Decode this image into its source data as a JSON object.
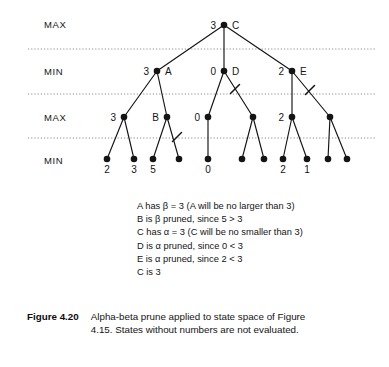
{
  "figure": {
    "number": "Figure 4.20",
    "caption": "Alpha-beta prune applied to state space of Figure 4.15. States without numbers are not evaluated."
  },
  "levels": [
    {
      "label": "MAX",
      "x": 44,
      "y": 19
    },
    {
      "label": "MIN",
      "x": 44,
      "y": 66
    },
    {
      "label": "MAX",
      "x": 44,
      "y": 112
    },
    {
      "label": "MIN",
      "x": 44,
      "y": 155
    }
  ],
  "separators": [
    {
      "y": 49
    },
    {
      "y": 94
    },
    {
      "y": 138
    }
  ],
  "nodes": [
    {
      "id": "C",
      "x": 224,
      "y": 25,
      "value": "3",
      "name": "C",
      "value_side": "left",
      "name_side": "right"
    },
    {
      "id": "A",
      "x": 157,
      "y": 71,
      "value": "3",
      "name": "A",
      "value_side": "left",
      "name_side": "right"
    },
    {
      "id": "D",
      "x": 224,
      "y": 71,
      "value": "0",
      "name": "D",
      "value_side": "left",
      "name_side": "right"
    },
    {
      "id": "E",
      "x": 292,
      "y": 71,
      "value": "2",
      "name": "E",
      "value_side": "left",
      "name_side": "right"
    },
    {
      "id": "m1",
      "x": 124,
      "y": 117,
      "value": "3",
      "name": "",
      "value_side": "left",
      "name_side": "right"
    },
    {
      "id": "B",
      "x": 167,
      "y": 117,
      "value": "",
      "name": "B",
      "value_side": "left",
      "name_side": "left"
    },
    {
      "id": "m3",
      "x": 208,
      "y": 117,
      "value": "0",
      "name": "",
      "value_side": "left",
      "name_side": "right"
    },
    {
      "id": "m4",
      "x": 253,
      "y": 117,
      "value": "",
      "name": "",
      "value_side": "left",
      "name_side": "right"
    },
    {
      "id": "m5",
      "x": 292,
      "y": 117,
      "value": "2",
      "name": "",
      "value_side": "left",
      "name_side": "right"
    },
    {
      "id": "m6",
      "x": 330,
      "y": 117,
      "value": "",
      "name": "",
      "value_side": "left",
      "name_side": "right"
    }
  ],
  "leaves": [
    {
      "id": "l1",
      "x": 107,
      "y": 159,
      "value": "2"
    },
    {
      "id": "l2",
      "x": 134,
      "y": 159,
      "value": "3"
    },
    {
      "id": "l3",
      "x": 153,
      "y": 159,
      "value": "5"
    },
    {
      "id": "l4",
      "x": 179,
      "y": 159,
      "value": ""
    },
    {
      "id": "l5",
      "x": 208,
      "y": 159,
      "value": "0"
    },
    {
      "id": "l6",
      "x": 242,
      "y": 159,
      "value": ""
    },
    {
      "id": "l7",
      "x": 264,
      "y": 159,
      "value": ""
    },
    {
      "id": "l8",
      "x": 283,
      "y": 159,
      "value": "2"
    },
    {
      "id": "l9",
      "x": 307,
      "y": 159,
      "value": "1"
    },
    {
      "id": "l10",
      "x": 328,
      "y": 159,
      "value": ""
    },
    {
      "id": "l11",
      "x": 347,
      "y": 159,
      "value": ""
    }
  ],
  "edges": [
    {
      "from": "C",
      "to": "A"
    },
    {
      "from": "C",
      "to": "D"
    },
    {
      "from": "C",
      "to": "E"
    },
    {
      "from": "A",
      "to": "m1"
    },
    {
      "from": "A",
      "to": "B"
    },
    {
      "from": "D",
      "to": "m3"
    },
    {
      "from": "D",
      "to": "m4"
    },
    {
      "from": "E",
      "to": "m5"
    },
    {
      "from": "E",
      "to": "m6"
    },
    {
      "from": "m1",
      "to": "l1"
    },
    {
      "from": "m1",
      "to": "l2"
    },
    {
      "from": "B",
      "to": "l3"
    },
    {
      "from": "B",
      "to": "l4"
    },
    {
      "from": "m3",
      "to": "l5"
    },
    {
      "from": "m4",
      "to": "l6"
    },
    {
      "from": "m4",
      "to": "l7"
    },
    {
      "from": "m5",
      "to": "l8"
    },
    {
      "from": "m5",
      "to": "l9"
    },
    {
      "from": "m6",
      "to": "l10"
    },
    {
      "from": "m6",
      "to": "l11"
    }
  ],
  "prune_marks": [
    {
      "on_edge": "D-m4",
      "x": 235,
      "y": 89
    },
    {
      "on_edge": "E-m6",
      "x": 310,
      "y": 90
    },
    {
      "on_edge": "B-l4",
      "x": 177,
      "y": 137
    }
  ],
  "annotations": [
    "A has  β = 3 (A will be no larger than 3)",
    "B is  β pruned, since 5 > 3",
    "C has  α = 3 (C will be no smaller than 3)",
    "D is  α pruned, since 0 < 3",
    "E is  α pruned, since 2 < 3",
    "C is 3"
  ],
  "colors": {
    "ink": "#141414",
    "separator": "#8c8c8c",
    "background": "#ffffff"
  }
}
